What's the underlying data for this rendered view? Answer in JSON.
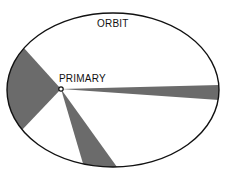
{
  "diagram": {
    "labels": {
      "orbit": "ORBIT",
      "primary": "PRIMARY"
    },
    "colors": {
      "background": "#ffffff",
      "orbit_stroke": "#111111",
      "sector_fill": "#6b6b6b",
      "primary_fill": "#ffffff",
      "primary_stroke": "#111111"
    },
    "orbit": {
      "cx": 113,
      "cy": 90,
      "rx": 106,
      "ry": 77
    },
    "primary": {
      "x": 61,
      "y": 89,
      "r": 2.2
    },
    "sectors": [
      {
        "name": "left-sector",
        "p1": [
          23,
          47
        ],
        "p2": [
          23,
          129
        ]
      },
      {
        "name": "right-sector",
        "p1": [
          219,
          85
        ],
        "p2": [
          219,
          100
        ]
      },
      {
        "name": "bottom-sector",
        "p1": [
          84,
          167
        ],
        "p2": [
          117,
          167
        ]
      }
    ]
  }
}
